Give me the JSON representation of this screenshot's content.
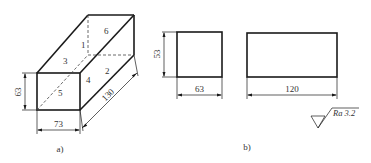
{
  "figure_a": {
    "caption": "a)",
    "face_labels": [
      "1",
      "2",
      "3",
      "4",
      "5",
      "6"
    ],
    "dimensions": {
      "height": "63",
      "width": "73",
      "length": "130"
    }
  },
  "figure_b": {
    "caption": "b)",
    "dimensions": {
      "height": "53",
      "width": "63",
      "length": "120"
    },
    "roughness": {
      "symbol": "surface-roughness-symbol",
      "label": "Ra 3.2"
    }
  }
}
